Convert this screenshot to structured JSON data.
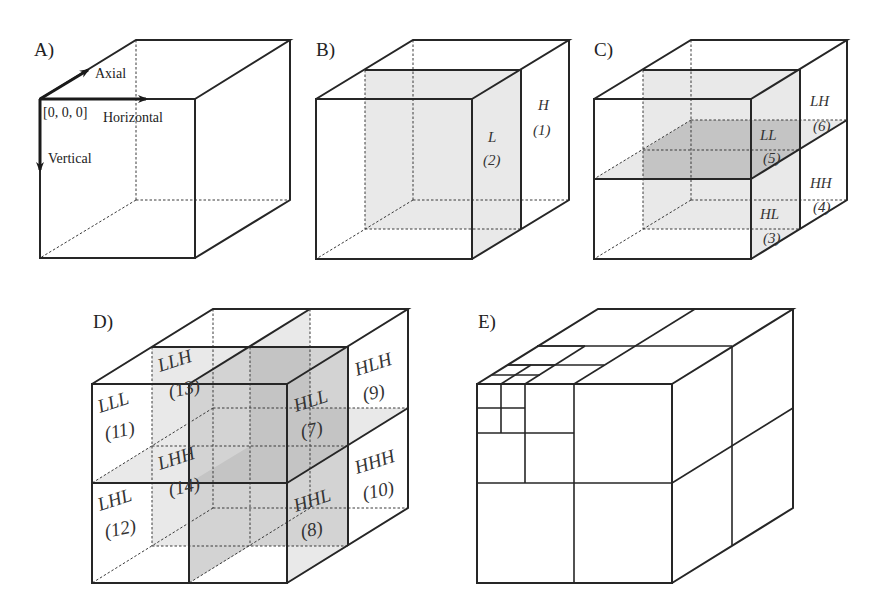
{
  "figure": {
    "panels": [
      {
        "id": "A",
        "label": "A)",
        "axes": {
          "axial": "Axial",
          "horizontal": "Horizontal",
          "vertical": "Vertical",
          "origin": "[0, 0, 0]"
        }
      },
      {
        "id": "B",
        "label": "B)",
        "subbands": [
          {
            "name": "L",
            "index": "(2)"
          },
          {
            "name": "H",
            "index": "(1)"
          }
        ]
      },
      {
        "id": "C",
        "label": "C)",
        "subbands": [
          {
            "name": "LL",
            "index": "(5)"
          },
          {
            "name": "LH",
            "index": "(6)"
          },
          {
            "name": "HL",
            "index": "(3)"
          },
          {
            "name": "HH",
            "index": "(4)"
          }
        ]
      },
      {
        "id": "D",
        "label": "D)",
        "subbands": [
          {
            "name": "LLL",
            "index": "(11)"
          },
          {
            "name": "LLH",
            "index": "(13)"
          },
          {
            "name": "LHL",
            "index": "(12)"
          },
          {
            "name": "LHH",
            "index": "(14)"
          },
          {
            "name": "HLL",
            "index": "(7)"
          },
          {
            "name": "HLH",
            "index": "(9)"
          },
          {
            "name": "HHL",
            "index": "(8)"
          },
          {
            "name": "HHH",
            "index": "(10)"
          }
        ]
      },
      {
        "id": "E",
        "label": "E)"
      }
    ],
    "colors": {
      "line": "#262626",
      "shade_light": "#e9e9e9",
      "shade_mid": "#d3d3d3",
      "shade_dark": "#c4c4c4",
      "background": "#ffffff"
    }
  }
}
